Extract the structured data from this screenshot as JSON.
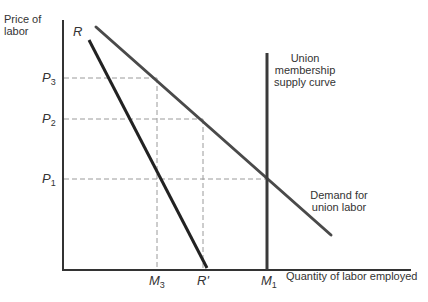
{
  "diagram": {
    "y_axis_label": [
      "Price of",
      "labor"
    ],
    "x_axis_label": "Quantity of labor employed",
    "curves": {
      "restricted_demand_label": "R",
      "restricted_demand_end_label": "R'",
      "supply_label": [
        "Union",
        "membership",
        "supply curve"
      ],
      "demand_label": [
        "Demand for",
        "union labor"
      ]
    },
    "price_ticks": [
      {
        "base": "P",
        "sub": "3"
      },
      {
        "base": "P",
        "sub": "2"
      },
      {
        "base": "P",
        "sub": "1"
      }
    ],
    "quantity_ticks": [
      {
        "base": "M",
        "sub": "3"
      },
      {
        "base": "R'",
        "sub": ""
      },
      {
        "base": "M",
        "sub": "1"
      }
    ],
    "colors": {
      "axis": "#333333",
      "curve": "#333333",
      "restricted": "#222222",
      "guide": "#999999"
    }
  }
}
